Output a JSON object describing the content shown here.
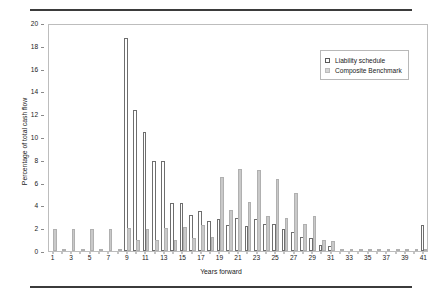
{
  "chart_data": {
    "type": "bar",
    "title": "",
    "xlabel": "Years forward",
    "ylabel": "Percentage of total cash flow",
    "ylim": [
      0,
      20
    ],
    "ytick_step": 2,
    "yticks": [
      0,
      2,
      4,
      6,
      8,
      10,
      12,
      14,
      16,
      18,
      20
    ],
    "xlim": [
      1,
      41
    ],
    "x": [
      1,
      2,
      3,
      4,
      5,
      6,
      7,
      8,
      9,
      10,
      11,
      12,
      13,
      14,
      15,
      16,
      17,
      18,
      19,
      20,
      21,
      22,
      23,
      24,
      25,
      26,
      27,
      28,
      29,
      30,
      31,
      32,
      33,
      34,
      35,
      36,
      37,
      38,
      39,
      40,
      41
    ],
    "xtick_labels": [
      "1",
      "3",
      "5",
      "7",
      "9",
      "11",
      "13",
      "15",
      "17",
      "19",
      "21",
      "23",
      "25",
      "27",
      "29",
      "31",
      "33",
      "35",
      "37",
      "39",
      "41"
    ],
    "grid": false,
    "legend_position": "top-right",
    "series": [
      {
        "name": "Liability schedule",
        "color": "#ffffff",
        "edge_color": "#6e6e6e",
        "values": [
          0,
          0,
          0,
          0,
          0,
          0,
          0,
          0,
          18.7,
          12.4,
          10.4,
          7.9,
          7.9,
          4.2,
          4.2,
          3.2,
          3.5,
          2.6,
          2.8,
          2.3,
          2.9,
          2.2,
          2.8,
          2.4,
          2.4,
          1.9,
          1.7,
          1.2,
          1.1,
          0.5,
          0.4,
          0,
          0,
          0,
          0,
          0,
          0,
          0,
          0,
          0,
          2.3
        ]
      },
      {
        "name": "Composite Benchmark",
        "color": "#c9c9c9",
        "edge_color": "#b0b0b0",
        "values": [
          1.9,
          0.2,
          1.9,
          0.2,
          1.9,
          0.2,
          1.9,
          0.2,
          2.0,
          1.0,
          1.9,
          1.0,
          2.0,
          1.0,
          2.1,
          1.1,
          2.3,
          1.2,
          6.5,
          3.6,
          7.2,
          4.3,
          7.1,
          3.1,
          6.3,
          2.9,
          5.1,
          2.4,
          3.1,
          1.0,
          0.9,
          0.15,
          0.15,
          0.15,
          0.15,
          0.15,
          0.15,
          0.15,
          0.15,
          0.15,
          0.15
        ]
      }
    ]
  },
  "legend": {
    "items": [
      {
        "label": "Liability schedule"
      },
      {
        "label": "Composite Benchmark"
      }
    ]
  }
}
